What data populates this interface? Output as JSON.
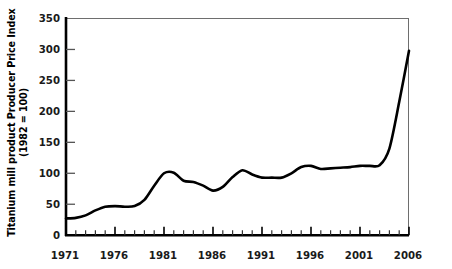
{
  "chart_data": {
    "type": "line",
    "title": "",
    "xlabel": "",
    "ylabel": "Titanium mill product Producer Price Index (1982 = 100)",
    "ylabel_line1": "Titanium mill product Producer Price Index",
    "ylabel_line2": "(1982 = 100)",
    "xlim": [
      1971,
      2006
    ],
    "ylim": [
      0,
      350
    ],
    "grid": false,
    "legend": "none",
    "line_color": "#000000",
    "yticks": [
      0,
      50,
      100,
      150,
      200,
      250,
      300,
      350
    ],
    "ytick_labels": [
      "0",
      "50",
      "100",
      "150",
      "200",
      "250",
      "300",
      "350"
    ],
    "xticks": [
      1971,
      1976,
      1981,
      1986,
      1991,
      1996,
      2001,
      2006
    ],
    "xtick_labels": [
      "1971",
      "1976",
      "1981",
      "1986",
      "1991",
      "1996",
      "2001",
      "2006"
    ],
    "x_minor_tick_interval": 1,
    "x": [
      1971,
      1972,
      1973,
      1974,
      1975,
      1976,
      1977,
      1978,
      1979,
      1980,
      1981,
      1982,
      1983,
      1984,
      1985,
      1986,
      1987,
      1988,
      1989,
      1990,
      1991,
      1992,
      1993,
      1994,
      1995,
      1996,
      1997,
      1998,
      1999,
      2000,
      2001,
      2002,
      2003,
      2004,
      2005,
      2006
    ],
    "values": [
      27,
      28,
      32,
      40,
      46,
      47,
      46,
      47,
      57,
      80,
      100,
      101,
      88,
      86,
      80,
      72,
      78,
      94,
      105,
      98,
      93,
      93,
      93,
      100,
      110,
      112,
      107,
      108,
      109,
      110,
      112,
      112,
      113,
      140,
      215,
      298
    ]
  }
}
